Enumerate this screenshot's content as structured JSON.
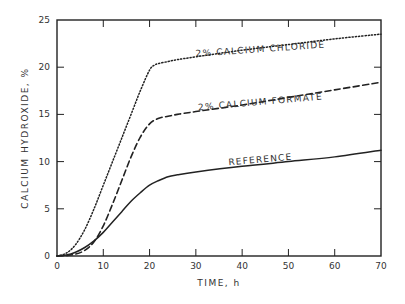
{
  "chart_data": {
    "type": "line",
    "title": "",
    "xlabel": "TIME, h",
    "ylabel": "CALCIUM HYDROXIDE, %",
    "xlim": [
      0,
      70
    ],
    "ylim": [
      0,
      25
    ],
    "xticks": [
      0,
      10,
      20,
      30,
      40,
      50,
      60,
      70
    ],
    "yticks": [
      0,
      5,
      10,
      15,
      20,
      25
    ],
    "xtick_labels": [
      "0",
      "10",
      "20",
      "30",
      "40",
      "50",
      "60",
      "70"
    ],
    "ytick_labels": [
      "0",
      "5",
      "10",
      "15",
      "20",
      "25"
    ],
    "grid": false,
    "legend": "inline labels on curves",
    "series": [
      {
        "name": "2% CALCIUM CHLORIDE",
        "style": "dotted",
        "x": [
          0,
          2,
          4,
          6,
          8,
          10,
          12,
          14,
          16,
          18,
          20,
          21,
          22,
          24,
          26,
          30,
          40,
          50,
          60,
          70
        ],
        "y": [
          0,
          0.3,
          1.2,
          2.8,
          5.0,
          7.5,
          10.0,
          12.5,
          15.0,
          17.5,
          19.7,
          20.2,
          20.4,
          20.6,
          20.8,
          21.1,
          21.8,
          22.4,
          23.0,
          23.5
        ]
      },
      {
        "name": "2% CALCIUM FORMATE",
        "style": "dashed",
        "x": [
          0,
          2,
          4,
          6,
          8,
          10,
          12,
          14,
          16,
          18,
          20,
          22,
          24,
          26,
          30,
          40,
          50,
          60,
          70
        ],
        "y": [
          0,
          0.05,
          0.2,
          0.6,
          1.5,
          3.2,
          5.5,
          8.0,
          10.5,
          12.6,
          14.0,
          14.6,
          14.8,
          15.0,
          15.3,
          16.0,
          16.8,
          17.6,
          18.4
        ]
      },
      {
        "name": "REFERENCE",
        "style": "solid",
        "x": [
          0,
          2,
          4,
          6,
          8,
          10,
          12,
          14,
          16,
          18,
          20,
          22,
          24,
          26,
          30,
          40,
          50,
          60,
          70
        ],
        "y": [
          0,
          0.1,
          0.4,
          0.9,
          1.6,
          2.5,
          3.6,
          4.7,
          5.8,
          6.7,
          7.5,
          8.0,
          8.4,
          8.6,
          8.9,
          9.5,
          10.0,
          10.5,
          11.2
        ]
      }
    ],
    "annotations": [
      {
        "text": "2% CALCIUM CHLORIDE",
        "x": 44,
        "y": 21.6
      },
      {
        "text": "2% CALCIUM FORMATE",
        "x": 44,
        "y": 16.0
      },
      {
        "text": "REFERENCE",
        "x": 44,
        "y": 9.9
      }
    ]
  }
}
